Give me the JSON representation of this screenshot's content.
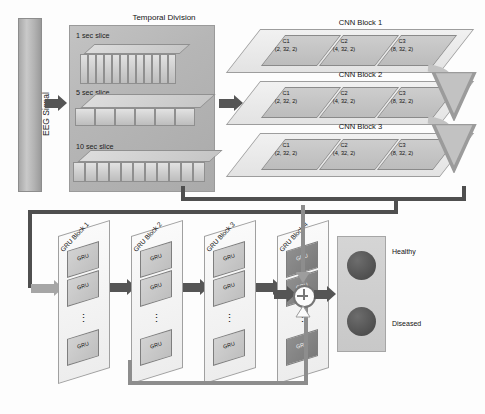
{
  "input": {
    "signal_label": "EEG Signal"
  },
  "temporal_division": {
    "title": "Temporal Division",
    "slices": [
      {
        "label": "1 sec slice",
        "cells": 12
      },
      {
        "label": "5 sec slice",
        "cells": 6
      },
      {
        "label": "10 sec slice",
        "cells": 11
      }
    ]
  },
  "cnn": {
    "blocks": [
      {
        "title": "CNN Block 1",
        "convs": [
          {
            "name": "C1",
            "params": "(2, 32, 2)"
          },
          {
            "name": "C2",
            "params": "(4, 32, 2)"
          },
          {
            "name": "C3",
            "params": "(8, 32, 2)"
          }
        ]
      },
      {
        "title": "CNN Block 2",
        "convs": [
          {
            "name": "C1",
            "params": "(2, 32, 2)"
          },
          {
            "name": "C2",
            "params": "(4, 32, 2)"
          },
          {
            "name": "C3",
            "params": "(8, 32, 2)"
          }
        ]
      },
      {
        "title": "CNN Block 3",
        "convs": [
          {
            "name": "C1",
            "params": "(2, 32, 2)"
          },
          {
            "name": "C2",
            "params": "(4, 32, 2)"
          },
          {
            "name": "C3",
            "params": "(8, 32, 2)"
          }
        ]
      }
    ]
  },
  "gru": {
    "cell_label": "GRU",
    "ellipsis": "⋮",
    "blocks": [
      {
        "title": "GRU Block 1",
        "shade": "light"
      },
      {
        "title": "GRU Block 2",
        "shade": "light"
      },
      {
        "title": "GRU Block 3",
        "shade": "light"
      },
      {
        "title": "GRU Block 4",
        "shade": "dark"
      }
    ]
  },
  "aggregation": {
    "operator": "+"
  },
  "output": {
    "classes": [
      {
        "label": "Healthy"
      },
      {
        "label": "Diseased"
      }
    ]
  },
  "colors": {
    "arrow_dark": "#555555",
    "arrow_mid": "#6b6b6b",
    "arrow_pale": "#a6a6a6",
    "panel_grey": "#b6b6b6",
    "node_fill": "#4f4f4f"
  }
}
